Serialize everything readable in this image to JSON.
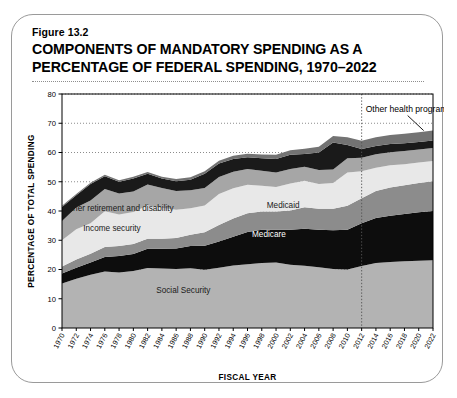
{
  "figure": {
    "number": "Figure 13.2",
    "title": "COMPONENTS OF MANDATORY SPENDING AS A PERCENTAGE OF FEDERAL SPENDING, 1970–2022"
  },
  "chart_data": {
    "type": "area",
    "stacked": true,
    "title": "COMPONENTS OF MANDATORY SPENDING AS A PERCENTAGE OF FEDERAL SPENDING, 1970–2022",
    "xlabel": "FISCAL YEAR",
    "ylabel": "PERCENTAGE OF TOTAL SPENDING",
    "xlim": [
      1970,
      2022
    ],
    "ylim": [
      0,
      80
    ],
    "yticks": [
      0,
      10,
      20,
      30,
      40,
      50,
      60,
      70,
      80
    ],
    "grid": "horizontal-dotted",
    "legend": "inline-band-labels",
    "projection_divider_year": 2012,
    "x": [
      1970,
      1972,
      1974,
      1976,
      1978,
      1980,
      1982,
      1984,
      1986,
      1988,
      1990,
      1992,
      1994,
      1996,
      1998,
      2000,
      2002,
      2004,
      2006,
      2008,
      2010,
      2012,
      2014,
      2016,
      2018,
      2020,
      2022
    ],
    "xtick_labels": [
      "1970",
      "1972",
      "1974",
      "1976",
      "1978",
      "1980",
      "1982",
      "1984",
      "1986",
      "1988",
      "1990",
      "1992",
      "1994",
      "1996",
      "1998",
      "2000",
      "2002",
      "2004",
      "2006",
      "2008",
      "2010",
      "2012",
      "2014",
      "2016",
      "2018",
      "2020",
      "2022"
    ],
    "series": [
      {
        "name": "Social Security",
        "color": "#b3b3b3",
        "label_color": "dark",
        "values": [
          15.2,
          16.8,
          18.2,
          19.3,
          19.0,
          19.5,
          20.5,
          20.3,
          20.2,
          20.4,
          19.9,
          20.6,
          21.4,
          21.8,
          22.2,
          22.4,
          21.6,
          21.3,
          20.8,
          20.2,
          20.0,
          21.2,
          22.2,
          22.6,
          22.8,
          23.0,
          23.2
        ]
      },
      {
        "name": "Medicare",
        "color": "#0d0d0d",
        "label_color": "light",
        "values": [
          3.4,
          3.8,
          4.2,
          5.0,
          5.6,
          5.8,
          6.6,
          6.8,
          7.0,
          7.6,
          8.2,
          9.0,
          9.8,
          11.0,
          11.4,
          11.2,
          12.0,
          12.6,
          12.8,
          13.2,
          13.6,
          14.6,
          15.4,
          15.8,
          16.2,
          16.6,
          16.8
        ]
      },
      {
        "name": "Medicaid",
        "color": "#8c8c8c",
        "label_color": "dark",
        "values": [
          2.4,
          2.8,
          3.0,
          3.4,
          3.4,
          3.4,
          3.4,
          3.4,
          3.6,
          3.9,
          4.6,
          5.6,
          6.2,
          6.4,
          6.2,
          6.2,
          6.6,
          7.4,
          7.2,
          7.4,
          8.2,
          8.6,
          9.2,
          9.6,
          9.8,
          10.0,
          10.2
        ]
      },
      {
        "name": "Income security",
        "color": "#e8e8e8",
        "label_color": "dark",
        "values": [
          9.0,
          10.4,
          10.4,
          12.2,
          10.8,
          11.0,
          11.4,
          10.6,
          9.6,
          9.0,
          9.2,
          10.6,
          10.4,
          9.8,
          8.8,
          8.4,
          9.2,
          9.0,
          8.4,
          8.8,
          11.4,
          9.2,
          8.0,
          7.6,
          7.2,
          7.0,
          6.9
        ]
      },
      {
        "name": "Other retirement and disability",
        "color": "#a6a6a6",
        "label_color": "dark",
        "values": [
          6.6,
          7.4,
          7.8,
          7.6,
          7.2,
          7.0,
          7.2,
          6.8,
          6.4,
          6.2,
          6.0,
          5.8,
          5.6,
          5.4,
          5.2,
          5.0,
          5.0,
          4.8,
          4.8,
          4.6,
          4.8,
          4.6,
          4.6,
          4.5,
          4.5,
          4.4,
          4.4
        ]
      },
      {
        "name": "Other mandatory",
        "color": "#1a1a1a",
        "label_color": "light",
        "values": [
          4.8,
          4.2,
          5.6,
          4.4,
          4.0,
          4.4,
          3.6,
          3.2,
          3.4,
          3.6,
          4.8,
          4.6,
          4.4,
          4.0,
          4.2,
          4.6,
          4.8,
          4.4,
          6.0,
          9.2,
          4.6,
          3.0,
          2.8,
          2.8,
          2.7,
          2.6,
          2.6
        ]
      },
      {
        "name": "Other health programs",
        "color": "#737373",
        "label_color": "dark",
        "values": [
          0.4,
          0.4,
          0.5,
          0.5,
          0.5,
          0.6,
          0.6,
          0.6,
          0.7,
          0.8,
          0.9,
          1.0,
          1.1,
          1.2,
          1.3,
          1.4,
          1.6,
          1.8,
          2.0,
          2.2,
          2.6,
          2.8,
          3.0,
          3.1,
          3.2,
          3.3,
          3.4
        ]
      }
    ],
    "annotations": [
      {
        "text": "Other health programs",
        "x": 2012,
        "y": 74,
        "type": "callout-with-leader"
      },
      {
        "text": "Other retirement and disability",
        "x": 1978,
        "y": 40,
        "type": "band-label"
      },
      {
        "text": "Income security",
        "x": 1977,
        "y": 33,
        "type": "band-label"
      },
      {
        "text": "Medicaid",
        "x": 2001,
        "y": 41,
        "type": "band-label"
      },
      {
        "text": "Medicare",
        "x": 1999,
        "y": 31,
        "type": "band-label"
      },
      {
        "text": "Social Security",
        "x": 1987,
        "y": 12,
        "type": "band-label"
      }
    ]
  }
}
